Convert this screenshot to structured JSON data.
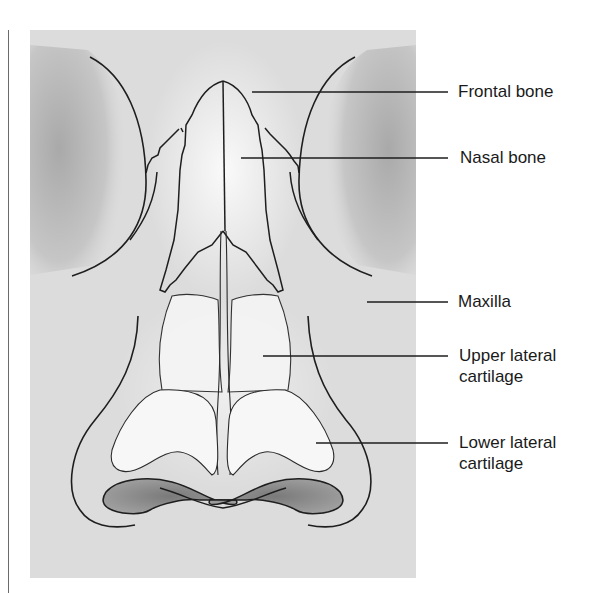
{
  "figure": {
    "labels": [
      {
        "id": "frontal-bone",
        "text": "Frontal bone",
        "x": 458,
        "y": 83,
        "leader": {
          "x1": 252,
          "y1": 92,
          "x2": 448,
          "y2": 92
        }
      },
      {
        "id": "nasal-bone",
        "text": "Nasal bone",
        "x": 461,
        "y": 148,
        "leader": {
          "x1": 241,
          "y1": 158,
          "x2": 448,
          "y2": 158
        }
      },
      {
        "id": "maxilla",
        "text": "Maxilla",
        "x": 458,
        "y": 290,
        "leader": {
          "x1": 367,
          "y1": 302,
          "x2": 448,
          "y2": 302
        }
      },
      {
        "id": "upper-lateral-cartilage",
        "text": "Upper lateral\ncartilage",
        "x": 459,
        "y": 345,
        "leader": {
          "x1": 263,
          "y1": 356,
          "x2": 448,
          "y2": 356
        }
      },
      {
        "id": "lower-lateral-cartilage",
        "text": "Lower lateral\ncartilage",
        "x": 459,
        "y": 432,
        "leader": {
          "x1": 316,
          "y1": 443,
          "x2": 448,
          "y2": 443
        }
      }
    ]
  },
  "colors": {
    "panel": "#dcdcdc",
    "shadow": "#b4b4b4",
    "highlight": "#f6f6f6",
    "line": "#1e1e1e",
    "nostril": "#8e8e8e",
    "text": "#1a1a1a"
  }
}
